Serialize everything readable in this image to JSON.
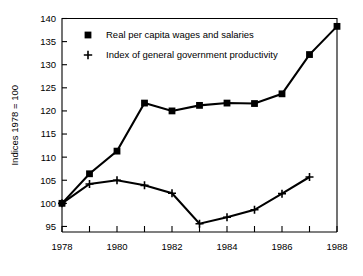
{
  "chart_data": {
    "type": "line",
    "title": "",
    "subtitle": "",
    "xlabel": "",
    "ylabel": "Indices 1978 = 100",
    "x": [
      1978,
      1979,
      1980,
      1981,
      1982,
      1983,
      1984,
      1985,
      1986,
      1987,
      1988
    ],
    "xtick_labels": [
      "1978",
      "1980",
      "1982",
      "1984",
      "1986",
      "1988"
    ],
    "xtick_values": [
      1978,
      1980,
      1982,
      1984,
      1986,
      1988
    ],
    "xminor_values": [
      1979,
      1981,
      1983,
      1985,
      1987
    ],
    "ytick_labels": [
      "95",
      "100",
      "105",
      "110",
      "115",
      "120",
      "125",
      "130",
      "135",
      "140"
    ],
    "ytick_values": [
      95,
      100,
      105,
      110,
      115,
      120,
      125,
      130,
      135,
      140
    ],
    "xlim": [
      1978,
      1988
    ],
    "ylim": [
      93.8,
      140
    ],
    "grid": false,
    "legend_position": "upper-left-inside",
    "series": [
      {
        "name": "Real per capita wages and salaries",
        "marker": "square",
        "color": "#000000",
        "x": [
          1978,
          1979,
          1980,
          1981,
          1982,
          1983,
          1984,
          1985,
          1986,
          1987,
          1988
        ],
        "values": [
          100.0,
          106.4,
          111.3,
          121.7,
          120.0,
          121.2,
          121.7,
          121.6,
          123.7,
          132.2,
          138.3
        ]
      },
      {
        "name": "Index of general government productivity",
        "marker": "plus",
        "color": "#000000",
        "x": [
          1978,
          1979,
          1980,
          1981,
          1982,
          1983,
          1984,
          1985,
          1986,
          1987
        ],
        "values": [
          100.0,
          104.2,
          105.0,
          103.9,
          102.2,
          95.6,
          97.0,
          98.6,
          102.1,
          105.7
        ]
      }
    ],
    "legend": [
      {
        "label": "Real per capita wages and salaries",
        "marker": "square"
      },
      {
        "label": "Index of general government productivity",
        "marker": "plus"
      }
    ]
  }
}
